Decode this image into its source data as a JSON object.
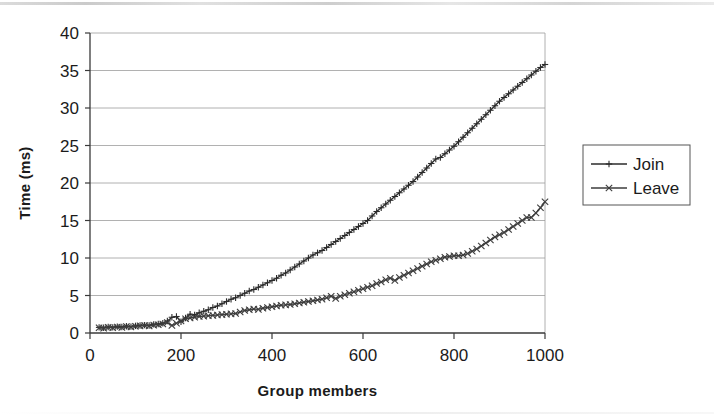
{
  "chart_data": {
    "type": "line",
    "title": "",
    "xlabel": "Group members",
    "ylabel": "Time (ms)",
    "xlim": [
      0,
      1000
    ],
    "ylim": [
      0,
      40
    ],
    "xticks": [
      0,
      200,
      400,
      600,
      800,
      1000
    ],
    "yticks": [
      0,
      5,
      10,
      15,
      20,
      25,
      30,
      35,
      40
    ],
    "grid": "horizontal",
    "legend_position": "right",
    "legend": [
      "Join",
      "Leave"
    ],
    "markers": {
      "Join": "plus",
      "Leave": "x"
    },
    "colors": {
      "Join": "#2b2b2b",
      "Leave": "#3d3d3d",
      "axis": "#3a3a3a",
      "grid": "#9a9a9a"
    },
    "x": [
      20,
      30,
      40,
      50,
      60,
      70,
      80,
      90,
      100,
      110,
      120,
      130,
      140,
      150,
      160,
      170,
      180,
      190,
      200,
      210,
      220,
      230,
      240,
      250,
      260,
      270,
      280,
      290,
      300,
      310,
      320,
      330,
      340,
      350,
      360,
      370,
      380,
      390,
      400,
      410,
      420,
      430,
      440,
      450,
      460,
      470,
      480,
      490,
      500,
      510,
      520,
      530,
      540,
      550,
      560,
      570,
      580,
      590,
      600,
      610,
      620,
      630,
      640,
      650,
      660,
      670,
      680,
      690,
      700,
      710,
      720,
      730,
      740,
      750,
      760,
      770,
      780,
      790,
      800,
      810,
      820,
      830,
      840,
      850,
      860,
      870,
      880,
      890,
      900,
      910,
      920,
      930,
      940,
      950,
      960,
      970,
      980,
      990,
      1000
    ],
    "series": [
      {
        "name": "Join",
        "marker": "plus",
        "values": [
          0.75,
          0.7,
          0.8,
          0.75,
          0.85,
          0.8,
          0.9,
          0.85,
          0.95,
          1.0,
          1.05,
          1.0,
          1.15,
          1.2,
          1.3,
          1.6,
          2.1,
          2.2,
          1.5,
          2.0,
          2.5,
          2.4,
          2.7,
          2.9,
          3.1,
          3.4,
          3.6,
          3.9,
          4.2,
          4.5,
          4.7,
          5.0,
          5.3,
          5.6,
          5.8,
          6.1,
          6.4,
          6.7,
          7.0,
          7.3,
          7.7,
          8.0,
          8.4,
          8.8,
          9.2,
          9.6,
          10.0,
          10.4,
          10.7,
          11.0,
          11.4,
          11.8,
          12.2,
          12.6,
          13.0,
          13.4,
          13.8,
          14.2,
          14.6,
          15.0,
          15.6,
          16.2,
          16.7,
          17.2,
          17.7,
          18.2,
          18.7,
          19.2,
          19.7,
          20.2,
          20.8,
          21.4,
          22.0,
          22.6,
          23.2,
          23.4,
          23.9,
          24.4,
          24.9,
          25.5,
          26.1,
          26.7,
          27.3,
          27.9,
          28.5,
          29.1,
          29.7,
          30.3,
          30.9,
          31.4,
          31.9,
          32.4,
          32.9,
          33.4,
          33.9,
          34.4,
          34.9,
          35.4,
          35.8
        ]
      },
      {
        "name": "Leave",
        "marker": "x",
        "values": [
          0.7,
          0.65,
          0.75,
          0.7,
          0.8,
          0.75,
          0.85,
          0.8,
          0.9,
          0.95,
          1.0,
          0.95,
          1.05,
          1.1,
          1.2,
          1.4,
          1.0,
          1.3,
          1.6,
          1.9,
          2.0,
          2.1,
          2.2,
          2.25,
          2.3,
          2.35,
          2.4,
          2.45,
          2.5,
          2.55,
          2.6,
          2.8,
          3.0,
          3.1,
          3.2,
          3.15,
          3.3,
          3.4,
          3.5,
          3.6,
          3.7,
          3.75,
          3.8,
          3.9,
          4.0,
          4.1,
          4.2,
          4.3,
          4.4,
          4.5,
          4.7,
          4.9,
          4.6,
          4.9,
          5.1,
          5.3,
          5.5,
          5.7,
          5.9,
          6.1,
          6.3,
          6.6,
          6.8,
          7.1,
          7.3,
          7.0,
          7.4,
          7.7,
          8.0,
          8.3,
          8.6,
          8.9,
          9.2,
          9.5,
          9.7,
          9.9,
          10.1,
          10.2,
          10.3,
          10.3,
          10.4,
          10.6,
          10.9,
          11.2,
          11.6,
          12.0,
          12.4,
          12.8,
          13.1,
          13.4,
          13.8,
          14.2,
          14.6,
          15.0,
          15.4,
          15.4,
          16.0,
          16.7,
          17.5
        ]
      }
    ]
  }
}
